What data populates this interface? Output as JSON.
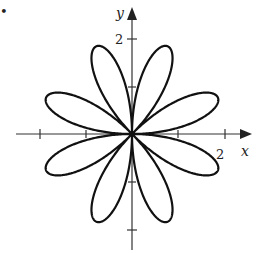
{
  "bullet": "•",
  "chart_data": {
    "type": "line",
    "subtype": "polar-rose",
    "title": "",
    "equation": "r = 2 sin(4θ)",
    "petals": 8,
    "amplitude": 2,
    "xlabel": "x",
    "ylabel": "y",
    "xtick_labels": [
      "2"
    ],
    "ytick_labels": [
      "2"
    ],
    "xlim": [
      -2.5,
      2.6
    ],
    "ylim": [
      -2.5,
      2.8
    ],
    "grid": false,
    "legend": null,
    "petal_tip_angles_deg": [
      22.5,
      67.5,
      112.5,
      157.5,
      202.5,
      247.5,
      292.5,
      337.5
    ]
  },
  "colors": {
    "curve": "#111111",
    "axis": "#333333",
    "background": "#ffffff"
  }
}
